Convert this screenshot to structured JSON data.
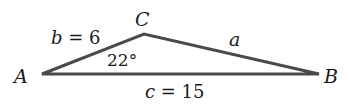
{
  "diagram": {
    "type": "triangle",
    "vertices": {
      "A": {
        "label": "A"
      },
      "B": {
        "label": "B"
      },
      "C": {
        "label": "C"
      }
    },
    "sides": {
      "b": {
        "var": "b",
        "eq": " = 6"
      },
      "a": {
        "var": "a"
      },
      "c": {
        "var": "c",
        "eq": " = 15"
      }
    },
    "angle_A": "22°",
    "colors": {
      "stroke": "#4a4a4a",
      "text": "#1a1a1a"
    }
  }
}
